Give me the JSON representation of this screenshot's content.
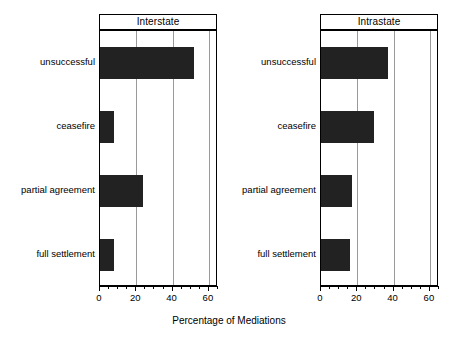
{
  "chart_data": {
    "type": "bar",
    "orientation": "horizontal",
    "title": "",
    "xlabel": "Percentage of Mediations",
    "ylabel": "",
    "xlim": [
      0,
      65
    ],
    "xticks": [
      0,
      20,
      40,
      60
    ],
    "xtick_labels": [
      "0",
      "20",
      "40",
      "60"
    ],
    "minor_tick_step": 5,
    "grid": "vertical",
    "legend": "none",
    "categories": [
      "unsuccessful",
      "ceasefire",
      "partial agreement",
      "full settlement"
    ],
    "panels": [
      {
        "title": "Interstate",
        "values": [
          52,
          7.5,
          23.5,
          7.5
        ]
      },
      {
        "title": "Intrastate",
        "values": [
          37,
          29,
          17,
          16
        ]
      }
    ],
    "bar_color": "#222222"
  },
  "axis": {
    "xlabel": "Percentage of Mediations",
    "ticks": [
      "0",
      "20",
      "40",
      "60"
    ]
  },
  "panel_left": {
    "title": "Interstate",
    "categories": [
      "unsuccessful",
      "ceasefire",
      "partial agreement",
      "full settlement"
    ]
  },
  "panel_right": {
    "title": "Intrastate",
    "categories": [
      "unsuccessful",
      "ceasefire",
      "partial agreement",
      "full settlement"
    ]
  }
}
